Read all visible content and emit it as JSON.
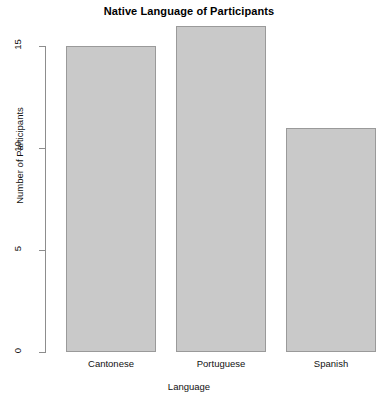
{
  "chart_data": {
    "type": "bar",
    "title": "Native Language of Participants",
    "xlabel": "Language",
    "ylabel": "Number of Participants",
    "categories": [
      "Cantonese",
      "Portuguese",
      "Spanish"
    ],
    "values": [
      15,
      16,
      11
    ],
    "ylim": [
      0,
      16
    ],
    "yticks": [
      0,
      5,
      10,
      15
    ],
    "ytick_labels": [
      "0",
      "5",
      "10",
      "15"
    ],
    "grid": false,
    "legend": false,
    "bar_fill_color": "#c9c9c9",
    "bar_border_color": "#9a9a9a",
    "axis_color": "#8d8d8d",
    "background_color": "#ffffff"
  }
}
